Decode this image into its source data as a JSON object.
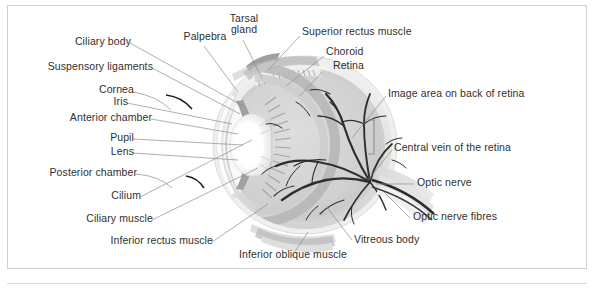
{
  "figure": {
    "caption": "",
    "background_color": "#ffffff",
    "frame_color": "#cfcfcf",
    "label_color": "#2f2f2f",
    "leader_color": "#8d8d8d"
  },
  "labels": {
    "ciliary_body": "Ciliary body",
    "palpebra": "Palpebra",
    "tarsal_gland": "Tarsal gland",
    "superior_rectus_muscle": "Superior rectus muscle",
    "choroid": "Choroid",
    "retina": "Retina",
    "suspensory_ligaments": "Suspensory ligaments",
    "cornea": "Cornea",
    "iris": "Iris",
    "anterior_chamber": "Anterior chamber",
    "pupil": "Pupil",
    "lens": "Lens",
    "posterior_chamber": "Posterior chamber",
    "cilium": "Cilium",
    "ciliary_muscle": "Ciliary muscle",
    "inferior_rectus_muscle": "Inferior rectus muscle",
    "inferior_oblique_muscle": "Inferior oblique muscle",
    "image_area_on_back_of_retina": "Image area on back of retina",
    "central_vein_of_the_retina": "Central vein of the retina",
    "optic_nerve": "Optic nerve",
    "optic_nerve_fibres": "Optic nerve fibres",
    "vitreous_body": "Vitreous body"
  },
  "colors": {
    "sclera_outer": "#e9e9e9",
    "sclera_mid": "#d6d6d6",
    "choroid_band": "#bdbdbd",
    "vitreous": "#d2d2d2",
    "lens_highlight": "#ffffff",
    "vessel_dark": "#3a3a3a",
    "muscle_gray": "#c4c4c4"
  }
}
